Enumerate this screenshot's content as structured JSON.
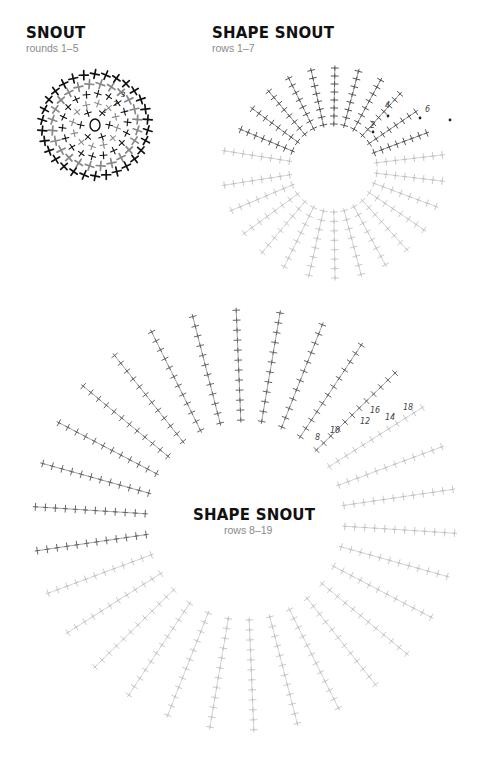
{
  "page": {
    "background": "#ffffff"
  },
  "diagrams": [
    {
      "id": "snout",
      "title": "SNOUT",
      "subtitle": "rounds 1–5",
      "center": [
        95,
        125
      ],
      "round_labels": [
        "1",
        "2",
        "3",
        "4",
        "5"
      ],
      "stitch_color_dark": "#111111",
      "stitch_color_light": "#888888"
    },
    {
      "id": "shape-snout-1",
      "title": "SHAPE SNOUT",
      "subtitle": "rows 1–7",
      "center": [
        333,
        168
      ],
      "row_labels": [
        "2",
        "4",
        "6"
      ],
      "stitch_color_dark": "#555555",
      "stitch_color_light": "#bbbbbb"
    },
    {
      "id": "shape-snout-2",
      "title": "SHAPE SNOUT",
      "subtitle": "rows 8–19",
      "center": [
        245,
        520
      ],
      "row_labels": [
        "8",
        "10",
        "12",
        "14",
        "16",
        "18"
      ],
      "stitch_color_dark": "#666666",
      "stitch_color_light": "#bbbbbb"
    }
  ]
}
